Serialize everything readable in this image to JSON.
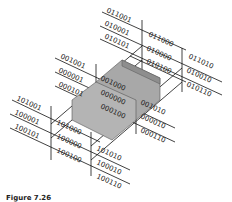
{
  "diagram": {
    "type": "karnaugh-map-3d",
    "labels": {
      "top_group": [
        "011001",
        "010001",
        "010101",
        "011000",
        "010000",
        "010100",
        "011010",
        "010010",
        "010110"
      ],
      "middle_group": [
        "001001",
        "000001",
        "000101",
        "001000",
        "000000",
        "000100",
        "001010",
        "000010",
        "000110"
      ],
      "bottom_group": [
        "101001",
        "100001",
        "100101",
        "101000",
        "100000",
        "100100",
        "101010",
        "100010",
        "100110"
      ]
    },
    "highlight": {
      "description": "shaded 3D box",
      "fill": "#a0a0a0"
    },
    "caption": "Figure 7.26"
  }
}
